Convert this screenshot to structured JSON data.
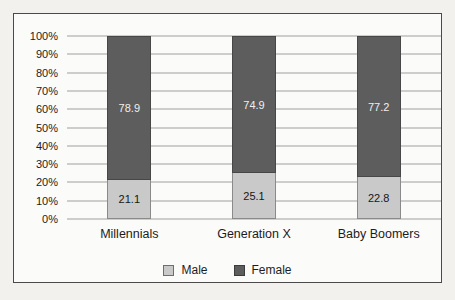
{
  "chart_data": {
    "type": "bar",
    "stacked": true,
    "orientation": "vertical",
    "title": "",
    "xlabel": "",
    "ylabel": "",
    "categories": [
      "Millennials",
      "Generation X",
      "Baby Boomers"
    ],
    "series": [
      {
        "name": "Male",
        "values": [
          21.1,
          25.1,
          22.8
        ],
        "color": "#c9c9c9"
      },
      {
        "name": "Female",
        "values": [
          78.9,
          74.9,
          77.2
        ],
        "color": "#5d5d5d"
      }
    ],
    "data_labels_shown": true,
    "ylim": [
      0,
      100
    ],
    "y_ticks": [
      "100%",
      "90%",
      "80%",
      "70%",
      "60%",
      "50%",
      "40%",
      "30%",
      "20%",
      "10%",
      "0%"
    ],
    "grid": "horizontal",
    "legend_position": "bottom-center",
    "colors": {
      "male": "#c9c9c9",
      "female": "#5d5d5d",
      "gridline": "#9f9f9f",
      "frame_border": "#4a4a4a",
      "frame_background": "#fbfbf9",
      "page_background": "#f2f1ee",
      "label_on_dark": "#efefef",
      "label_on_light": "#161616"
    }
  }
}
